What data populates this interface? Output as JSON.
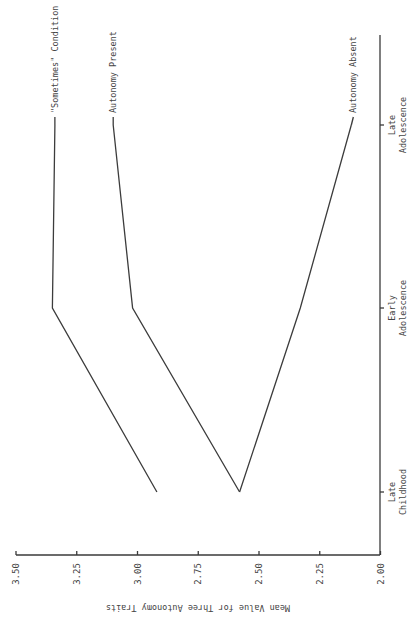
{
  "chart_data": {
    "type": "line",
    "orientation": "rotated-90-clockwise",
    "title": "",
    "xlabel": "",
    "ylabel": "Mean Value for Three Autonomy Traits",
    "categories": [
      "Late Childhood",
      "Early Adolescence",
      "Late Adolescence"
    ],
    "category_labels": [
      [
        "Late",
        "Childhood"
      ],
      [
        "Early",
        "Adolescence"
      ],
      [
        "Late",
        "Adolescence"
      ]
    ],
    "ylim": [
      2.0,
      3.5
    ],
    "yticks": [
      "3.50",
      "3.25",
      "3.00",
      "2.75",
      "2.50",
      "2.25",
      "2.00"
    ],
    "grid": false,
    "legend": "inline labels at line ends",
    "series": [
      {
        "name": "\"Sometimes\" Condition",
        "values": [
          2.92,
          3.35,
          3.34
        ]
      },
      {
        "name": "Autonomy Present",
        "values": [
          2.58,
          3.02,
          3.1
        ]
      },
      {
        "name": "Autonomy Absent",
        "values": [
          2.58,
          2.33,
          2.12
        ]
      }
    ]
  },
  "colors": {
    "line": "#3c3c3c",
    "text": "#444444",
    "background": "#ffffff"
  }
}
